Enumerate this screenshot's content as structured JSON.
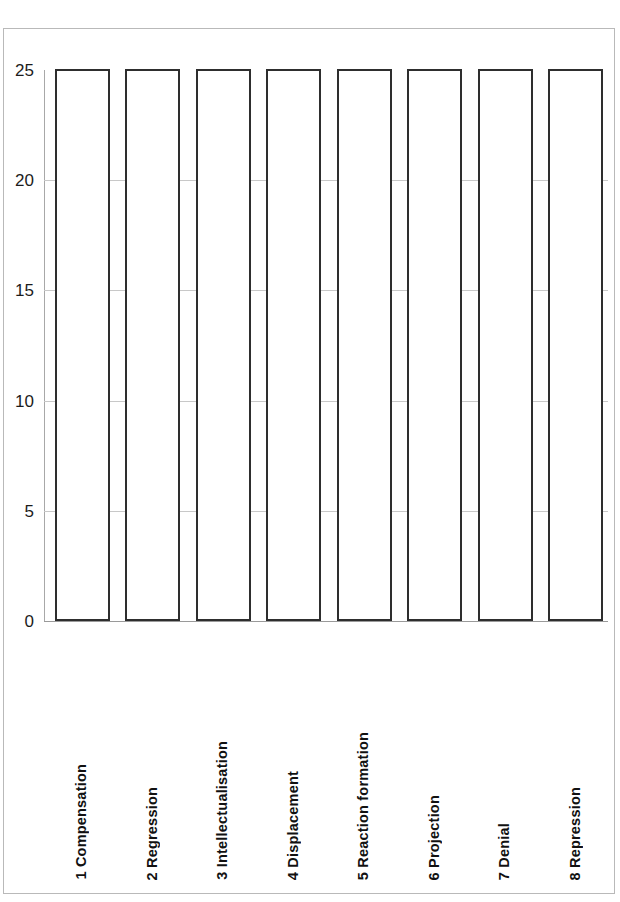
{
  "chart_data": {
    "type": "bar",
    "title": "",
    "subtitle": "",
    "xlabel": "",
    "ylabel": "",
    "categories": [
      "1 Compensation",
      "2 Regression",
      "3 Intellectualisation",
      "4 Displacement",
      "5 Reaction formation",
      "6 Projection",
      "7 Denial",
      "8 Repression"
    ],
    "values": [
      25,
      25,
      25,
      25,
      25,
      25,
      25,
      25
    ],
    "ylim": [
      0,
      25
    ],
    "ytick_labels": [
      "0",
      "5",
      "10",
      "15",
      "20",
      "25"
    ],
    "ytick_values": [
      0,
      5,
      10,
      15,
      20,
      25
    ],
    "grid": true,
    "legend": "none",
    "bar_fill_color": "#ffffff",
    "bar_border_color": "#2e2e2e",
    "gridline_color": "#c8c8c8",
    "axis_color": "#a8a8a8"
  },
  "page": {
    "frame_color": "#b9b9b9",
    "background_color": "#ffffff"
  },
  "artifacts": {
    "bleed_line_1": "",
    "bleed_line_2": "",
    "bleed_line_3": ""
  }
}
